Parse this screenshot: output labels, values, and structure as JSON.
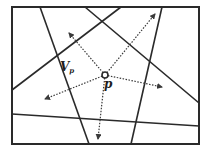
{
  "diagram": {
    "title": "",
    "colors": {
      "background": "#ffffff",
      "line": "#2a2a2a",
      "ray": "#3a3a3a"
    },
    "frame": {
      "x1": 12,
      "y1": 7,
      "x2": 199,
      "y2": 144
    },
    "lines": [
      {
        "id": "line-a",
        "x1": 40,
        "y1": 7,
        "x2": 89,
        "y2": 144
      },
      {
        "id": "line-b",
        "x1": 85,
        "y1": 7,
        "x2": 199,
        "y2": 103
      },
      {
        "id": "line-c",
        "x1": 121,
        "y1": 7,
        "x2": 12,
        "y2": 90
      },
      {
        "id": "line-d",
        "x1": 162,
        "y1": 7,
        "x2": 131,
        "y2": 144
      },
      {
        "id": "line-e",
        "x1": 12,
        "y1": 114,
        "x2": 199,
        "y2": 126
      }
    ],
    "point": {
      "name": "p",
      "x": 105,
      "y": 75,
      "r": 3
    },
    "rays": [
      {
        "id": "ray-up-left",
        "x2": 69,
        "y2": 33
      },
      {
        "id": "ray-up-right",
        "x2": 155,
        "y2": 14
      },
      {
        "id": "ray-left",
        "x2": 45,
        "y2": 99
      },
      {
        "id": "ray-down",
        "x2": 98,
        "y2": 139
      },
      {
        "id": "ray-right",
        "x2": 162,
        "y2": 87
      }
    ],
    "labels": {
      "region_main": "V",
      "region_sub": "p",
      "point": "p"
    }
  }
}
